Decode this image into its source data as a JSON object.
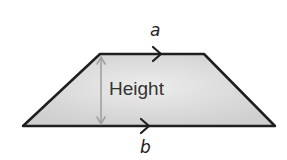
{
  "diagram": {
    "type": "trapezoid",
    "labels": {
      "top_side": "a",
      "bottom_side": "b",
      "height": "Height"
    },
    "colors": {
      "fill": "#d6d6d6",
      "outline": "#1f1f1f",
      "height_arrow": "#a0a0a0"
    },
    "geometry": {
      "top_edge": [
        [
          100,
          54
        ],
        [
          204,
          54
        ]
      ],
      "bottom_edge": [
        [
          23,
          126
        ],
        [
          275,
          126
        ]
      ],
      "height_arrow": [
        [
          101,
          57
        ],
        [
          101,
          124
        ]
      ]
    }
  }
}
